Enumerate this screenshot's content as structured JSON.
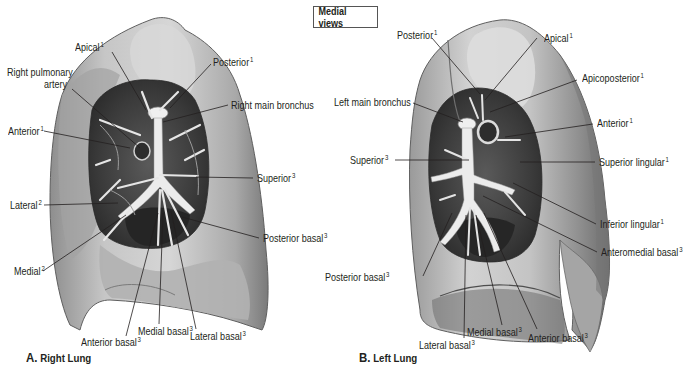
{
  "title": "Medial views",
  "panels": [
    {
      "id": "A",
      "caption_letter": "A.",
      "caption_text": "Right Lung",
      "labels": [
        {
          "name": "label-apical",
          "text": "Apical",
          "sup": "1"
        },
        {
          "name": "label-right-pulmonary-artery-line1",
          "text": "Right pulmonary",
          "sup": ""
        },
        {
          "name": "label-right-pulmonary-artery-line2",
          "text": "artery",
          "sup": ""
        },
        {
          "name": "label-posterior",
          "text": "Posterior",
          "sup": "1"
        },
        {
          "name": "label-right-main-bronchus",
          "text": "Right main bronchus",
          "sup": ""
        },
        {
          "name": "label-anterior",
          "text": "Anterior",
          "sup": "1"
        },
        {
          "name": "label-superior",
          "text": "Superior",
          "sup": "3"
        },
        {
          "name": "label-lateral",
          "text": "Lateral",
          "sup": "2"
        },
        {
          "name": "label-posterior-basal",
          "text": "Posterior basal",
          "sup": "3"
        },
        {
          "name": "label-medial",
          "text": "Medial",
          "sup": "2"
        },
        {
          "name": "label-medial-basal",
          "text": "Medial basal",
          "sup": "3"
        },
        {
          "name": "label-anterior-basal",
          "text": "Anterior basal",
          "sup": "3"
        },
        {
          "name": "label-lateral-basal",
          "text": "Lateral basal",
          "sup": "3"
        }
      ]
    },
    {
      "id": "B",
      "caption_letter": "B.",
      "caption_text": "Left Lung",
      "labels": [
        {
          "name": "label-posterior",
          "text": "Posterior",
          "sup": "1"
        },
        {
          "name": "label-apical",
          "text": "Apical",
          "sup": "1"
        },
        {
          "name": "label-apicoposterior",
          "text": "Apicoposterior",
          "sup": "1"
        },
        {
          "name": "label-left-main-bronchus",
          "text": "Left main bronchus",
          "sup": ""
        },
        {
          "name": "label-anterior",
          "text": "Anterior",
          "sup": "1"
        },
        {
          "name": "label-superior",
          "text": "Superior",
          "sup": "3"
        },
        {
          "name": "label-superior-lingular",
          "text": "Superior lingular",
          "sup": "1"
        },
        {
          "name": "label-inferior-lingular",
          "text": "Inferior lingular",
          "sup": "1"
        },
        {
          "name": "label-anteromedial-basal",
          "text": "Anteromedial basal",
          "sup": "3"
        },
        {
          "name": "label-posterior-basal",
          "text": "Posterior basal",
          "sup": "3"
        },
        {
          "name": "label-medial-basal",
          "text": "Medial basal",
          "sup": "3"
        },
        {
          "name": "label-anterior-basal",
          "text": "Anterior basal",
          "sup": "3"
        },
        {
          "name": "label-lateral-basal",
          "text": "Lateral basal",
          "sup": "3"
        }
      ]
    }
  ],
  "colors": {
    "lung_surface": "#b9b9b9",
    "lung_highlight": "#dcdcdc",
    "lung_shadow": "#7d7d7d",
    "hilum_dark": "#3a3a3a",
    "bronchus": "#eeeeee",
    "leader_line": "#231f20",
    "text": "#231f20"
  }
}
